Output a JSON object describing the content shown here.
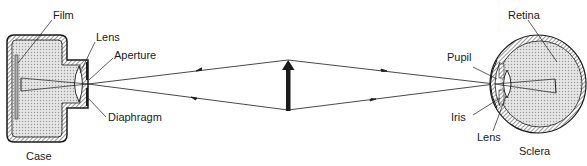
{
  "camera": {
    "labels": {
      "film": "Film",
      "lens": "Lens",
      "aperture": "Aperture",
      "diaphragm": "Diaphragm",
      "case": "Case"
    }
  },
  "eye": {
    "labels": {
      "retina": "Retina",
      "pupil": "Pupil",
      "iris": "Iris",
      "lens": "Lens",
      "sclera": "Sclera"
    }
  },
  "object": {
    "name": "object-arrow"
  },
  "colors": {
    "ink": "#1a1a1a",
    "fill": "#d8d8d8",
    "background": "#ffffff"
  }
}
